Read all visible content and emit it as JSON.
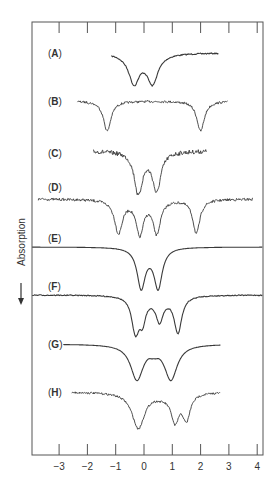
{
  "chart_data": {
    "type": "line",
    "title": "",
    "xlabel": "",
    "ylabel": "Absorption",
    "ylabel_arrow": "down",
    "xlim": [
      -3.9,
      4.2
    ],
    "x_ticks": [
      -3,
      -2,
      -1,
      0,
      1,
      2,
      3,
      4
    ],
    "x_tick_labels": [
      "−3",
      "−2",
      "−1",
      "0",
      "1",
      "2",
      "3",
      "4"
    ],
    "grid": false,
    "legend": "none",
    "stacked_offset": true,
    "series": [
      {
        "name": "A",
        "label": "(A)",
        "noisy": false,
        "noise": 0.6,
        "x_start": -1.15,
        "x_end": 2.65,
        "baseline_y": 53,
        "dips": [
          {
            "x": -0.35,
            "depth": 27,
            "width": 0.22
          },
          {
            "x": 0.3,
            "depth": 27,
            "width": 0.22
          }
        ],
        "broad": 0.55
      },
      {
        "name": "B",
        "label": "(B)",
        "noisy": true,
        "noise": 1.1,
        "x_start": -2.35,
        "x_end": 2.95,
        "baseline_y": 101,
        "dips": [
          {
            "x": -1.3,
            "depth": 30,
            "width": 0.16
          },
          {
            "x": 2.0,
            "depth": 30,
            "width": 0.16
          }
        ],
        "broad": 0
      },
      {
        "name": "C",
        "label": "(C)",
        "noisy": true,
        "noise": 2.2,
        "x_start": -1.8,
        "x_end": 2.2,
        "baseline_y": 151,
        "dips": [
          {
            "x": -0.2,
            "depth": 40,
            "width": 0.17
          },
          {
            "x": 0.45,
            "depth": 37,
            "width": 0.17
          }
        ],
        "broad": 0.35
      },
      {
        "name": "D",
        "label": "(D)",
        "noisy": true,
        "noise": 1.3,
        "x_start": -3.75,
        "x_end": 3.85,
        "baseline_y": 199,
        "dips": [
          {
            "x": -0.9,
            "depth": 33,
            "width": 0.17
          },
          {
            "x": -0.15,
            "depth": 34,
            "width": 0.16
          },
          {
            "x": 0.45,
            "depth": 33,
            "width": 0.16
          },
          {
            "x": 1.85,
            "depth": 34,
            "width": 0.15
          }
        ],
        "broad": 0
      },
      {
        "name": "E",
        "label": "(E)",
        "noisy": false,
        "noise": 0,
        "x_start": -3.95,
        "x_end": 4.2,
        "baseline_y": 247,
        "dips": [
          {
            "x": -0.1,
            "depth": 38,
            "width": 0.17
          },
          {
            "x": 0.5,
            "depth": 38,
            "width": 0.17
          }
        ],
        "broad": 0.35
      },
      {
        "name": "F",
        "label": "(F)",
        "noisy": false,
        "noise": 0.5,
        "x_start": -3.95,
        "x_end": 4.2,
        "baseline_y": 295,
        "dips": [
          {
            "x": -0.3,
            "depth": 36,
            "width": 0.16
          },
          {
            "x": -0.05,
            "depth": 20,
            "width": 0.12
          },
          {
            "x": 0.55,
            "depth": 22,
            "width": 0.15
          },
          {
            "x": 1.2,
            "depth": 37,
            "width": 0.16
          }
        ],
        "broad": 0.4
      },
      {
        "name": "G",
        "label": "(G)",
        "noisy": false,
        "noise": 0,
        "x_start": -2.85,
        "x_end": 2.7,
        "baseline_y": 344,
        "dips": [
          {
            "x": -0.25,
            "depth": 35,
            "width": 0.27
          },
          {
            "x": 0.95,
            "depth": 35,
            "width": 0.27
          }
        ],
        "broad": 0.1
      },
      {
        "name": "H",
        "label": "(H)",
        "noisy": true,
        "noise": 1.0,
        "x_start": -2.55,
        "x_end": 2.7,
        "baseline_y": 392,
        "dips": [
          {
            "x": -0.2,
            "depth": 36,
            "width": 0.27
          },
          {
            "x": 1.1,
            "depth": 26,
            "width": 0.16
          },
          {
            "x": 1.5,
            "depth": 26,
            "width": 0.16
          }
        ],
        "broad": 0.3
      }
    ]
  },
  "colors": {
    "line": "#3a3a3a",
    "frame": "#555555",
    "text": "#333333",
    "background": "#ffffff"
  }
}
